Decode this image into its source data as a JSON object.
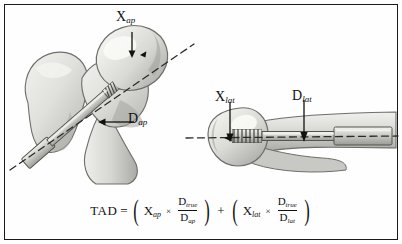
{
  "figure": {
    "border_color": "#1a1a1a",
    "background_color": "#ffffff"
  },
  "panels": [
    {
      "name": "ap-view",
      "view": "anteroposterior",
      "description": "Proximal femur with lag screw, AP projection",
      "bone_fill": "#e3e3e1",
      "bone_shade": "#b9b9b6",
      "implant_fill": "#cfcfcc",
      "labels": [
        "X_ap",
        "D_ap"
      ]
    },
    {
      "name": "lateral-view",
      "view": "lateral",
      "description": "Proximal femur with lag screw, lateral projection",
      "bone_fill": "#e3e3e1",
      "bone_shade": "#b9b9b6",
      "implant_fill": "#cfcfcc",
      "labels": [
        "X_lat",
        "D_lat"
      ]
    }
  ],
  "labels": {
    "x_ap": {
      "base": "X",
      "sub": "ap"
    },
    "d_ap": {
      "base": "D",
      "sub": "ap"
    },
    "x_lat": {
      "base": "X",
      "sub": "lat"
    },
    "d_lat": {
      "base": "D",
      "sub": "lat"
    }
  },
  "formula": {
    "lhs": "TAD",
    "equals": "=",
    "plus": "+",
    "times": "×",
    "term1": {
      "variable": {
        "base": "X",
        "sub": "ap"
      },
      "numerator": {
        "base": "D",
        "sub": "true"
      },
      "denominator": {
        "base": "D",
        "sub": "ap"
      }
    },
    "term2": {
      "variable": {
        "base": "X",
        "sub": "lat"
      },
      "numerator": {
        "base": "D",
        "sub": "true"
      },
      "denominator": {
        "base": "D",
        "sub": "lat"
      }
    },
    "plain_text": "TAD = (X_ap × D_true/D_ap) + (X_lat × D_true/D_lat)"
  }
}
